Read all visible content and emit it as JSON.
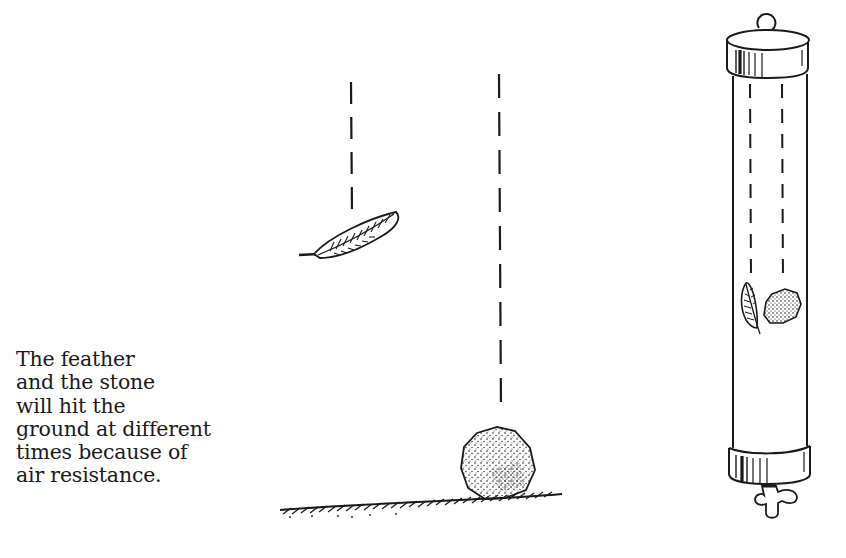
{
  "caption": {
    "lines": [
      "The feather",
      "and the stone",
      "will hit the",
      "ground at different",
      "times because of",
      "air resistance."
    ]
  },
  "illustration": {
    "left_scene": {
      "objects": [
        "feather",
        "stone",
        "ground"
      ],
      "feather_path": "dashed-line",
      "stone_path": "dashed-line"
    },
    "right_scene": {
      "objects": [
        "vacuum-tube",
        "feather",
        "stone",
        "stopcock-valve"
      ],
      "feather_path": "dashed-line",
      "stone_path": "dashed-line"
    },
    "ink_color": "#1a1a1a",
    "background_color": "#ffffff"
  }
}
